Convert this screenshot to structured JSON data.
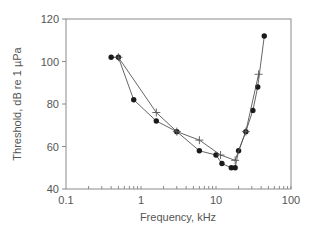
{
  "chart_data": {
    "type": "line",
    "title": "",
    "xlabel": "Frequency, kHz",
    "ylabel": "Threshold, dB re 1 µPa",
    "xscale": "log",
    "xlim": [
      0.1,
      100
    ],
    "ylim": [
      40,
      120
    ],
    "xticks": [
      "0.1",
      "1",
      "10",
      "100"
    ],
    "yticks": [
      "40",
      "60",
      "80",
      "100",
      "120"
    ],
    "grid": false,
    "legend": null,
    "series": [
      {
        "name": "Series 1 (filled circles)",
        "marker": "circle",
        "x": [
          0.4,
          0.5,
          0.8,
          1.6,
          3,
          6,
          10,
          12,
          16,
          18,
          20,
          25,
          31,
          36,
          44
        ],
        "y": [
          102,
          102,
          82,
          72,
          67,
          58,
          56,
          52,
          50,
          50,
          58,
          67,
          77,
          88,
          112
        ]
      },
      {
        "name": "Series 2 (crosses)",
        "marker": "cross",
        "x": [
          0.5,
          1.6,
          3,
          6,
          11.5,
          18,
          25,
          37
        ],
        "y": [
          102,
          76,
          67,
          63,
          56,
          53.5,
          67,
          94
        ]
      }
    ]
  },
  "colors": {
    "axis": "#8a8a8a",
    "line": "#555555",
    "marker": "#1a1a1a",
    "text": "#555555"
  }
}
